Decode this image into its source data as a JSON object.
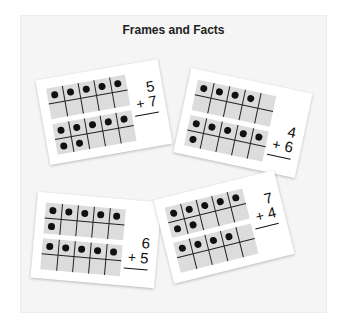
{
  "title": "Frames and Facts",
  "colors": {
    "page_background": "#ffffff",
    "panel_background": "#f5f5f5",
    "card_background": "#ffffff",
    "frame_cell": "#dcdcdc",
    "grid_line": "#222222",
    "dot": "#111111"
  },
  "cards": [
    {
      "id": "card-1",
      "top_frame_count": 5,
      "bottom_frame_count": 7,
      "fact": {
        "top": "5",
        "operator": "+",
        "bottom": "7"
      }
    },
    {
      "id": "card-2",
      "top_frame_count": 4,
      "bottom_frame_count": 6,
      "fact": {
        "top": "4",
        "operator": "+",
        "bottom": "6"
      }
    },
    {
      "id": "card-3",
      "top_frame_count": 6,
      "bottom_frame_count": 5,
      "fact": {
        "top": "6",
        "operator": "+",
        "bottom": "5"
      }
    },
    {
      "id": "card-4",
      "top_frame_count": 7,
      "bottom_frame_count": 4,
      "fact": {
        "top": "7",
        "operator": "+",
        "bottom": "4"
      }
    }
  ]
}
